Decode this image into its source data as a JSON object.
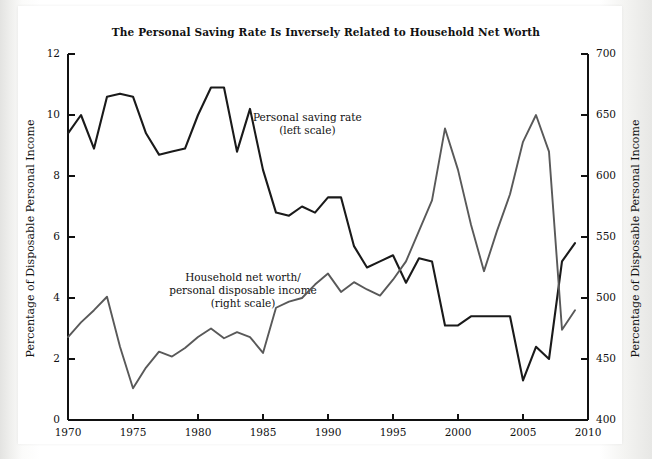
{
  "chart_data": {
    "type": "line",
    "title": "The Personal Saving Rate Is Inversely Related to Household Net Worth",
    "xlabel": "",
    "ylabel": "Percentage of Disposable Personal Income",
    "y2label": "Percentage of Disposable Personal Income",
    "xlim": [
      1970,
      2010
    ],
    "ylim": [
      0,
      12
    ],
    "y2lim": [
      400,
      700
    ],
    "grid": false,
    "legend_position": "inline-annotations",
    "xticks": [
      "1970",
      "1975",
      "1980",
      "1985",
      "1990",
      "1995",
      "2000",
      "2005",
      "2010"
    ],
    "yticks": [
      "0",
      "2",
      "4",
      "6",
      "8",
      "10",
      "12"
    ],
    "y2ticks": [
      "400",
      "450",
      "500",
      "550",
      "600",
      "650",
      "700"
    ],
    "x": [
      1970,
      1971,
      1972,
      1973,
      1974,
      1975,
      1976,
      1977,
      1978,
      1979,
      1980,
      1981,
      1982,
      1983,
      1984,
      1985,
      1986,
      1987,
      1988,
      1989,
      1990,
      1991,
      1992,
      1993,
      1994,
      1995,
      1996,
      1997,
      1998,
      1999,
      2000,
      2001,
      2002,
      2003,
      2004,
      2005,
      2006,
      2007,
      2008,
      2009
    ],
    "series": [
      {
        "name": "Personal saving rate",
        "axis": "left",
        "color": "#1a1a1a",
        "annotation": "Personal saving rate\n(left scale)",
        "values": [
          9.4,
          10.0,
          8.9,
          10.6,
          10.7,
          10.6,
          9.4,
          8.7,
          8.8,
          8.9,
          10.0,
          10.9,
          10.9,
          8.8,
          10.2,
          8.2,
          6.8,
          6.7,
          7.0,
          6.8,
          7.3,
          7.3,
          5.7,
          5.0,
          5.2,
          5.4,
          4.5,
          5.3,
          5.2,
          3.1,
          3.1,
          3.4,
          3.4,
          3.4,
          3.4,
          1.3,
          2.4,
          2.0,
          5.2,
          5.8
        ]
      },
      {
        "name": "Household net worth/personal disposable income",
        "axis": "right",
        "color": "#595959",
        "annotation": "Household net worth/\npersonal disposable income\n(right scale)",
        "values": [
          468,
          480,
          490,
          501,
          460,
          426,
          443,
          456,
          452,
          459,
          468,
          475,
          467,
          472,
          468,
          455,
          492,
          497,
          500,
          511,
          520,
          505,
          513,
          507,
          502,
          515,
          530,
          555,
          580,
          639,
          605,
          560,
          522,
          555,
          585,
          628,
          650,
          620,
          474,
          490
        ]
      }
    ]
  }
}
